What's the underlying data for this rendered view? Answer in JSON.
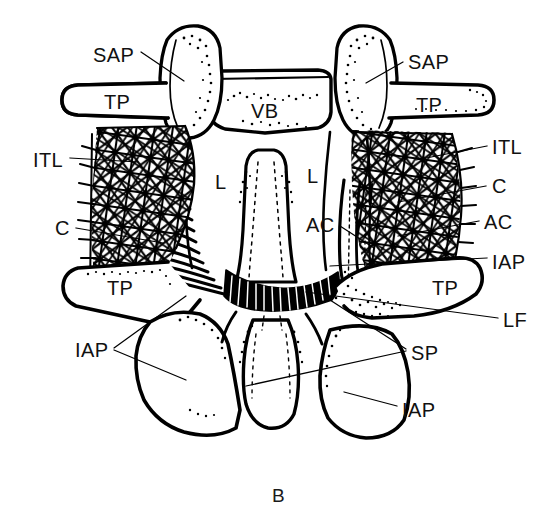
{
  "figure": {
    "panel_letter": "B",
    "view": "posterior view of lumbar vertebrae with ligaments",
    "background_color": "#ffffff",
    "ink_color": "#000000",
    "width": 558,
    "height": 521
  },
  "legend": {
    "abbreviations": [
      {
        "code": "SAP",
        "meaning": "superior articular process"
      },
      {
        "code": "TP",
        "meaning": "transverse process"
      },
      {
        "code": "VB",
        "meaning": "vertebral body"
      },
      {
        "code": "ITL",
        "meaning": "intertransverse ligament"
      },
      {
        "code": "C",
        "meaning": "capsule"
      },
      {
        "code": "L",
        "meaning": "lamina"
      },
      {
        "code": "AC",
        "meaning": "articular capsule"
      },
      {
        "code": "IAP",
        "meaning": "inferior articular process"
      },
      {
        "code": "LF",
        "meaning": "ligamentum flavum"
      },
      {
        "code": "SP",
        "meaning": "spinous process"
      }
    ]
  },
  "labels": [
    {
      "id": "sap-left",
      "text": "SAP",
      "x": 93,
      "y": 45,
      "side": "left"
    },
    {
      "id": "tp-left-up",
      "text": "TP",
      "x": 104,
      "y": 92,
      "side": "left"
    },
    {
      "id": "vb",
      "text": "VB",
      "x": 251,
      "y": 101,
      "side": "center"
    },
    {
      "id": "sap-right",
      "text": "SAP",
      "x": 408,
      "y": 52,
      "side": "right"
    },
    {
      "id": "tp-right-up",
      "text": "TP",
      "x": 416,
      "y": 95,
      "side": "right"
    },
    {
      "id": "itl-left",
      "text": "ITL",
      "x": 33,
      "y": 150,
      "side": "left"
    },
    {
      "id": "itl-right",
      "text": "ITL",
      "x": 492,
      "y": 137,
      "side": "right"
    },
    {
      "id": "l-left",
      "text": "L",
      "x": 215,
      "y": 172,
      "side": "center"
    },
    {
      "id": "l-right",
      "text": "L",
      "x": 307,
      "y": 166,
      "side": "center"
    },
    {
      "id": "c-right",
      "text": "C",
      "x": 492,
      "y": 176,
      "side": "right"
    },
    {
      "id": "c-left",
      "text": "C",
      "x": 55,
      "y": 218,
      "side": "left"
    },
    {
      "id": "ac-center",
      "text": "AC",
      "x": 306,
      "y": 215,
      "side": "center"
    },
    {
      "id": "ac-right",
      "text": "AC",
      "x": 484,
      "y": 212,
      "side": "right"
    },
    {
      "id": "iap-right-up",
      "text": "IAP",
      "x": 492,
      "y": 252,
      "side": "right"
    },
    {
      "id": "tp-left-lo",
      "text": "TP",
      "x": 107,
      "y": 278,
      "side": "left"
    },
    {
      "id": "tp-right-lo",
      "text": "TP",
      "x": 432,
      "y": 278,
      "side": "right"
    },
    {
      "id": "lf",
      "text": "LF",
      "x": 503,
      "y": 310,
      "side": "right"
    },
    {
      "id": "iap-left",
      "text": "IAP",
      "x": 75,
      "y": 340,
      "side": "left"
    },
    {
      "id": "sp",
      "text": "SP",
      "x": 411,
      "y": 343,
      "side": "right"
    },
    {
      "id": "iap-right-lo",
      "text": "IAP",
      "x": 402,
      "y": 400,
      "side": "right"
    }
  ]
}
